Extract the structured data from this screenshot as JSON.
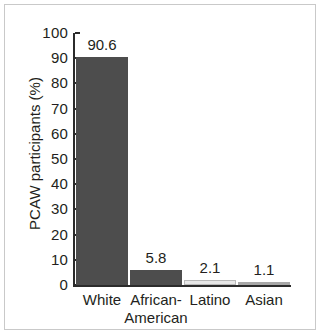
{
  "chart_data": {
    "type": "bar",
    "title": "",
    "subtitle": "",
    "xlabel": "",
    "ylabel": "PCAW participants (%)",
    "categories": [
      "White",
      "African-\nAmerican",
      "Latino",
      "Asian"
    ],
    "category_lines": [
      [
        "White"
      ],
      [
        "African-",
        "American"
      ],
      [
        "Latino"
      ],
      [
        "Asian"
      ]
    ],
    "values": [
      90.6,
      5.8,
      2.1,
      1.1
    ],
    "value_labels": [
      "90.6",
      "5.8",
      "2.1",
      "1.1"
    ],
    "bar_colors": [
      "#4d4d4d",
      "#4d4d4d",
      "#e8e8e8",
      "#a8a8a8"
    ],
    "ylim": [
      0,
      100
    ],
    "ytick_labels": [
      "100",
      "90",
      "80",
      "70",
      "60",
      "50",
      "40",
      "30",
      "20",
      "10",
      "0"
    ],
    "ytick_values": [
      100,
      90,
      80,
      70,
      60,
      50,
      40,
      30,
      20,
      10,
      0
    ],
    "grid": false,
    "legend": "none",
    "axis_color": "#2b2b2b",
    "text_color": "#231f20",
    "background": "#ffffff",
    "frame_color": "#c9c9c9"
  }
}
